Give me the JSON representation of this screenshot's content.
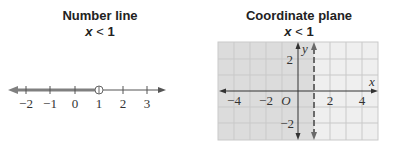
{
  "number_line": {
    "title": "Number line",
    "inequality_var": "x",
    "inequality_op": "<",
    "inequality_val": "1",
    "ticks": [
      "−2",
      "−1",
      "0",
      "1",
      "2",
      "3"
    ],
    "open_circle_at": 1,
    "shaded_direction": "left"
  },
  "coordinate_plane": {
    "title": "Coordinate plane",
    "inequality_var": "x",
    "inequality_op": "<",
    "inequality_val": "1",
    "x_axis_label": "x",
    "y_axis_label": "y",
    "origin_label": "O",
    "x_ticks": [
      "−4",
      "−2",
      "2",
      "4"
    ],
    "y_ticks": [
      "2",
      "−2"
    ],
    "boundary_line": "x = 1 (dashed)",
    "shaded_region": "x < 1"
  },
  "colors": {
    "shade": "#dedede",
    "unshaded": "#efefef",
    "grid": "#c9c9c9",
    "axis": "#333333",
    "number_line_ray": "#808080"
  }
}
